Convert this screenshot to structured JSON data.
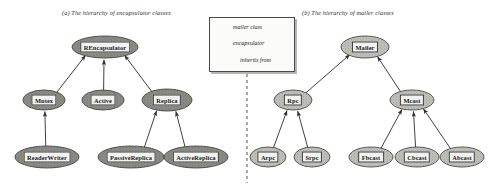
{
  "figure": {
    "width": 490,
    "height": 187,
    "background": "#ffffff",
    "divider": "vertical dashed line"
  },
  "panels": [
    {
      "id": "a",
      "caption": "(a) The hierarchy of encapsulator classes",
      "nodes": [
        {
          "id": "rencapsulator",
          "label": "REncapsulator",
          "kind": "encapsulator",
          "x": 105,
          "y": 47,
          "rx": 33,
          "ry": 11
        },
        {
          "id": "mutex",
          "label": "Mutex",
          "kind": "encapsulator",
          "x": 44,
          "y": 100,
          "rx": 21,
          "ry": 10
        },
        {
          "id": "active",
          "label": "Active",
          "kind": "encapsulator",
          "x": 103,
          "y": 100,
          "rx": 21,
          "ry": 10
        },
        {
          "id": "replica",
          "label": "Replica",
          "kind": "encapsulator",
          "x": 167,
          "y": 100,
          "rx": 25,
          "ry": 11
        },
        {
          "id": "readerwriter",
          "label": "ReaderWriter",
          "kind": "encapsulator",
          "x": 47,
          "y": 157,
          "rx": 32,
          "ry": 11
        },
        {
          "id": "passivereplica",
          "label": "PassiveReplica",
          "kind": "encapsulator",
          "x": 131,
          "y": 157,
          "rx": 33,
          "ry": 11
        },
        {
          "id": "activereplica",
          "label": "ActiveReplica",
          "kind": "encapsulator",
          "x": 196,
          "y": 157,
          "rx": 32,
          "ry": 11
        }
      ],
      "edges": [
        {
          "from": "mutex",
          "to": "rencapsulator",
          "relation": "inherits from"
        },
        {
          "from": "active",
          "to": "rencapsulator",
          "relation": "inherits from"
        },
        {
          "from": "replica",
          "to": "rencapsulator",
          "relation": "inherits from"
        },
        {
          "from": "readerwriter",
          "to": "mutex",
          "relation": "inherits from"
        },
        {
          "from": "passivereplica",
          "to": "replica",
          "relation": "inherits from"
        },
        {
          "from": "activereplica",
          "to": "replica",
          "relation": "inherits from"
        }
      ]
    },
    {
      "id": "b",
      "caption": "(b) The hierarchy of mailer classes",
      "nodes": [
        {
          "id": "mailer",
          "label": "Mailer",
          "kind": "mailer",
          "x": 365,
          "y": 47,
          "rx": 24,
          "ry": 11
        },
        {
          "id": "rpc",
          "label": "Rpc",
          "kind": "mailer",
          "x": 293,
          "y": 100,
          "rx": 19,
          "ry": 10
        },
        {
          "id": "mcast",
          "label": "Mcast",
          "kind": "mailer",
          "x": 412,
          "y": 100,
          "rx": 22,
          "ry": 10
        },
        {
          "id": "arpc",
          "label": "Arpc",
          "kind": "mailer",
          "x": 268,
          "y": 157,
          "rx": 18,
          "ry": 10
        },
        {
          "id": "srpc",
          "label": "Srpc",
          "kind": "mailer",
          "x": 312,
          "y": 157,
          "rx": 18,
          "ry": 10
        },
        {
          "id": "fbcast",
          "label": "Fbcast",
          "kind": "mailer",
          "x": 371,
          "y": 157,
          "rx": 22,
          "ry": 10
        },
        {
          "id": "cbcast",
          "label": "Cbcast",
          "kind": "mailer",
          "x": 417,
          "y": 157,
          "rx": 22,
          "ry": 10
        },
        {
          "id": "abcast",
          "label": "Abcast",
          "kind": "mailer",
          "x": 462,
          "y": 157,
          "rx": 22,
          "ry": 10
        }
      ],
      "edges": [
        {
          "from": "rpc",
          "to": "mailer",
          "relation": "inherits from"
        },
        {
          "from": "mcast",
          "to": "mailer",
          "relation": "inherits from"
        },
        {
          "from": "arpc",
          "to": "rpc",
          "relation": "inherits from"
        },
        {
          "from": "srpc",
          "to": "rpc",
          "relation": "inherits from"
        },
        {
          "from": "fbcast",
          "to": "mcast",
          "relation": "inherits from"
        },
        {
          "from": "cbcast",
          "to": "mcast",
          "relation": "inherits from"
        },
        {
          "from": "abcast",
          "to": "mcast",
          "relation": "inherits from"
        }
      ]
    }
  ],
  "legend": {
    "items": [
      {
        "symbol": "light-ellipse",
        "label": "mailer class"
      },
      {
        "symbol": "dark-ellipse",
        "label": "encapsulator"
      },
      {
        "symbol": "arrow",
        "label": "inherits from"
      }
    ]
  },
  "colors": {
    "ink": "#2b2b2b",
    "node_fill_light": "#c9c9c4",
    "node_fill_dark": "#7d7d78",
    "node_stroke": "#3a3a3a",
    "label_fill": "#f2f2f0",
    "legend_border": "#4a4a4a",
    "divider": "#555555"
  }
}
